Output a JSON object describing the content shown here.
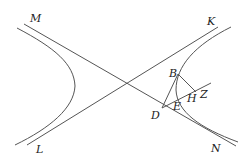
{
  "figure": {
    "labels": {
      "M": "M",
      "K": "K",
      "L": "L",
      "N": "N",
      "B": "B",
      "D": "D",
      "E": "E",
      "H": "H",
      "Z": "Z"
    },
    "colors": {
      "stroke": "#555555",
      "text": "#222222",
      "background": "#ffffff"
    }
  }
}
